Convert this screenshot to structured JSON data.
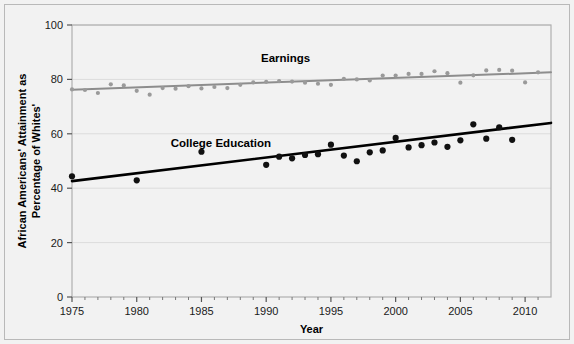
{
  "chart_data": {
    "type": "scatter",
    "title": "",
    "xlabel": "Year",
    "ylabel": "African Americans' Attainment as Percentage of Whites'",
    "xlim": [
      1975,
      2012
    ],
    "ylim": [
      0,
      100
    ],
    "xticks": [
      1975,
      1980,
      1985,
      1990,
      1995,
      2000,
      2005,
      2010
    ],
    "xtick_labels": [
      "1975",
      "1980",
      "1985",
      "1990",
      "1995",
      "2000",
      "2005",
      "2010"
    ],
    "yticks": [
      0,
      20,
      40,
      60,
      80,
      100
    ],
    "ytick_labels": [
      "0",
      "20",
      "40",
      "60",
      "80",
      "100"
    ],
    "minor_xticks_per_interval": 5,
    "grid": "horizontal-light",
    "legend_position": "inline-annotations",
    "series": [
      {
        "name": "Earnings",
        "color": "#9a9a9a",
        "marker": "circle",
        "label_x": 1991.5,
        "label_y": 86.5,
        "trendline": {
          "x0": 1975,
          "y0": 76.2,
          "x1": 2012,
          "y1": 82.6,
          "color": "#8d8d8d",
          "width": 2
        },
        "points": [
          {
            "x": 1975,
            "y": 76.3
          },
          {
            "x": 1976,
            "y": 76.1
          },
          {
            "x": 1977,
            "y": 75.0
          },
          {
            "x": 1978,
            "y": 78.2
          },
          {
            "x": 1979,
            "y": 77.8
          },
          {
            "x": 1980,
            "y": 75.8
          },
          {
            "x": 1981,
            "y": 74.4
          },
          {
            "x": 1982,
            "y": 76.8
          },
          {
            "x": 1983,
            "y": 76.6
          },
          {
            "x": 1984,
            "y": 77.5
          },
          {
            "x": 1985,
            "y": 76.7
          },
          {
            "x": 1986,
            "y": 77.2
          },
          {
            "x": 1987,
            "y": 76.8
          },
          {
            "x": 1988,
            "y": 78.0
          },
          {
            "x": 1989,
            "y": 78.9
          },
          {
            "x": 1990,
            "y": 79.1
          },
          {
            "x": 1991,
            "y": 79.4
          },
          {
            "x": 1992,
            "y": 79.2
          },
          {
            "x": 1993,
            "y": 78.8
          },
          {
            "x": 1994,
            "y": 78.4
          },
          {
            "x": 1995,
            "y": 78.0
          },
          {
            "x": 1996,
            "y": 80.2
          },
          {
            "x": 1997,
            "y": 80.0
          },
          {
            "x": 1998,
            "y": 79.6
          },
          {
            "x": 1999,
            "y": 81.4
          },
          {
            "x": 2000,
            "y": 81.4
          },
          {
            "x": 2001,
            "y": 82.0
          },
          {
            "x": 2002,
            "y": 82.0
          },
          {
            "x": 2003,
            "y": 83.0
          },
          {
            "x": 2004,
            "y": 82.3
          },
          {
            "x": 2005,
            "y": 78.8
          },
          {
            "x": 2006,
            "y": 81.5
          },
          {
            "x": 2007,
            "y": 83.3
          },
          {
            "x": 2008,
            "y": 83.5
          },
          {
            "x": 2009,
            "y": 83.2
          },
          {
            "x": 2010,
            "y": 78.9
          },
          {
            "x": 2011,
            "y": 82.6
          }
        ]
      },
      {
        "name": "College Education",
        "color": "#111111",
        "marker": "circle",
        "label_x": 1986.5,
        "label_y": 55.0,
        "trendline": {
          "x0": 1975,
          "y0": 42.6,
          "x1": 2012,
          "y1": 64.0,
          "color": "#000000",
          "width": 2.6
        },
        "points": [
          {
            "x": 1975,
            "y": 44.4
          },
          {
            "x": 1980,
            "y": 42.9
          },
          {
            "x": 1985,
            "y": 53.4
          },
          {
            "x": 1990,
            "y": 48.6
          },
          {
            "x": 1991,
            "y": 51.6
          },
          {
            "x": 1992,
            "y": 51.0
          },
          {
            "x": 1993,
            "y": 52.2
          },
          {
            "x": 1994,
            "y": 52.5
          },
          {
            "x": 1995,
            "y": 56.0
          },
          {
            "x": 1996,
            "y": 52.0
          },
          {
            "x": 1997,
            "y": 49.9
          },
          {
            "x": 1998,
            "y": 53.2
          },
          {
            "x": 1999,
            "y": 53.9
          },
          {
            "x": 2000,
            "y": 58.5
          },
          {
            "x": 2001,
            "y": 55.0
          },
          {
            "x": 2002,
            "y": 55.8
          },
          {
            "x": 2003,
            "y": 56.8
          },
          {
            "x": 2004,
            "y": 55.2
          },
          {
            "x": 2005,
            "y": 57.6
          },
          {
            "x": 2006,
            "y": 63.5
          },
          {
            "x": 2007,
            "y": 58.2
          },
          {
            "x": 2008,
            "y": 62.4
          },
          {
            "x": 2009,
            "y": 57.8
          }
        ]
      }
    ]
  },
  "axes": {
    "x_title": "Year",
    "y_title_line1": "African Americans' Attainment as",
    "y_title_line2": "Percentage of Whites'"
  },
  "colors": {
    "background": "#f2f2f2",
    "plot_background": "#f2f2f2",
    "frame": "#b9b9b9",
    "gridline": "#dcdcdc",
    "earnings": "#9a9a9a",
    "college": "#111111"
  }
}
